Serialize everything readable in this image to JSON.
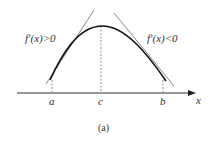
{
  "figure": {
    "caption": "(a)",
    "axis_label": "x",
    "points": [
      {
        "id": "a",
        "label": "a"
      },
      {
        "id": "c",
        "label": "c"
      },
      {
        "id": "b",
        "label": "b"
      }
    ],
    "annotations": {
      "left": "f′(x)>0",
      "right": "f′(x)<0"
    },
    "colors": {
      "curve": "#111111",
      "tangent": "#888888",
      "axis": "#333333",
      "dashed": "#777777"
    }
  }
}
